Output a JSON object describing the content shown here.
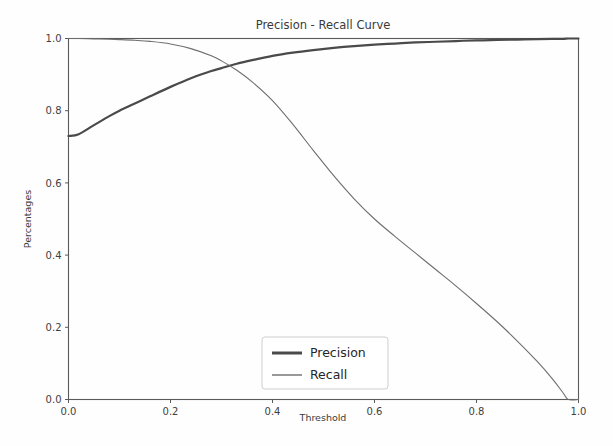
{
  "chart_data": {
    "type": "line",
    "title": "Precision - Recall Curve",
    "xlabel": "Threshold",
    "ylabel": "Percentages",
    "xlim": [
      0.0,
      1.0
    ],
    "ylim": [
      0.0,
      1.0
    ],
    "grid": false,
    "legend_position": "lower center",
    "xticks": [
      "0.0",
      "0.2",
      "0.4",
      "0.6",
      "0.8",
      "1.0"
    ],
    "xtick_values": [
      0.0,
      0.2,
      0.4,
      0.6,
      0.8,
      1.0
    ],
    "yticks": [
      "0.0",
      "0.2",
      "0.4",
      "0.6",
      "0.8",
      "1.0"
    ],
    "ytick_values": [
      0.0,
      0.2,
      0.4,
      0.6,
      0.8,
      1.0
    ],
    "x": [
      0.0,
      0.02,
      0.05,
      0.08,
      0.1,
      0.13,
      0.16,
      0.2,
      0.24,
      0.28,
      0.3,
      0.33,
      0.36,
      0.4,
      0.44,
      0.48,
      0.52,
      0.56,
      0.6,
      0.64,
      0.68,
      0.72,
      0.76,
      0.8,
      0.84,
      0.88,
      0.92,
      0.95,
      0.97,
      0.98,
      1.0
    ],
    "series": [
      {
        "name": "Precision",
        "color": "#4a4a4a",
        "linewidth": 2.2,
        "values": [
          0.73,
          0.735,
          0.76,
          0.785,
          0.8,
          0.82,
          0.84,
          0.866,
          0.89,
          0.91,
          0.918,
          0.93,
          0.94,
          0.952,
          0.961,
          0.968,
          0.974,
          0.979,
          0.983,
          0.986,
          0.989,
          0.991,
          0.993,
          0.995,
          0.996,
          0.997,
          0.998,
          0.999,
          0.999,
          1.0,
          1.0
        ]
      },
      {
        "name": "Recall",
        "color": "#6e6e6e",
        "linewidth": 1.1,
        "values": [
          1.0,
          1.0,
          0.999,
          0.998,
          0.997,
          0.995,
          0.992,
          0.985,
          0.972,
          0.952,
          0.938,
          0.912,
          0.88,
          0.828,
          0.762,
          0.69,
          0.62,
          0.556,
          0.5,
          0.452,
          0.406,
          0.36,
          0.314,
          0.266,
          0.216,
          0.162,
          0.104,
          0.055,
          0.018,
          0.0,
          0.0
        ]
      }
    ],
    "legend_entries": [
      {
        "label": "Precision",
        "color": "#4a4a4a",
        "linewidth": 3.0
      },
      {
        "label": "Recall",
        "color": "#6e6e6e",
        "linewidth": 1.4
      }
    ]
  }
}
